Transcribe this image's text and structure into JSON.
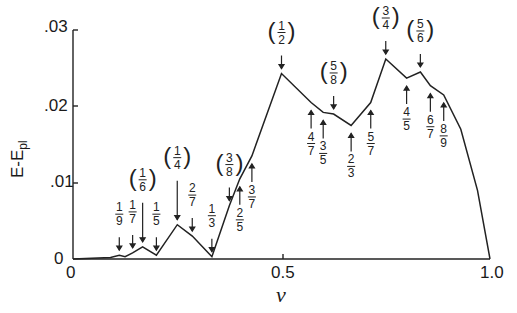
{
  "chart_data": {
    "type": "line",
    "title": "",
    "xlabel": "ν",
    "ylabel": "E-E_pl",
    "xlim": [
      0,
      1.0
    ],
    "ylim": [
      0,
      0.03
    ],
    "x_ticks": [
      "0",
      "0.5",
      "1.0"
    ],
    "y_ticks": [
      "0",
      ".01",
      ".02",
      ".03"
    ],
    "grid": false,
    "legend": null,
    "series": [
      {
        "name": "E-E_pl",
        "x": [
          0.0,
          0.09,
          0.111,
          0.125,
          0.143,
          0.167,
          0.2,
          0.25,
          0.286,
          0.333,
          0.375,
          0.4,
          0.429,
          0.5,
          0.571,
          0.6,
          0.625,
          0.667,
          0.714,
          0.75,
          0.8,
          0.833,
          0.857,
          0.889,
          0.93,
          0.97,
          1.0
        ],
        "y": [
          0.0,
          0.0002,
          0.0005,
          0.0003,
          0.0008,
          0.0016,
          0.0005,
          0.0045,
          0.003,
          0.0003,
          0.007,
          0.0105,
          0.0135,
          0.0243,
          0.0205,
          0.0192,
          0.019,
          0.0175,
          0.0205,
          0.0262,
          0.0237,
          0.0245,
          0.0227,
          0.0215,
          0.017,
          0.009,
          0.0
        ]
      }
    ],
    "annotations": [
      {
        "label": "1/9",
        "x": 0.111,
        "bracketed": false
      },
      {
        "label": "1/7",
        "x": 0.143,
        "bracketed": false
      },
      {
        "label": "(1/6)",
        "x": 0.167,
        "bracketed": true
      },
      {
        "label": "1/5",
        "x": 0.2,
        "bracketed": false
      },
      {
        "label": "(1/4)",
        "x": 0.25,
        "bracketed": true
      },
      {
        "label": "2/7",
        "x": 0.286,
        "bracketed": false
      },
      {
        "label": "1/3",
        "x": 0.333,
        "bracketed": false
      },
      {
        "label": "(3/8)",
        "x": 0.375,
        "bracketed": true
      },
      {
        "label": "2/5",
        "x": 0.4,
        "bracketed": false
      },
      {
        "label": "3/7",
        "x": 0.429,
        "bracketed": false
      },
      {
        "label": "(1/2)",
        "x": 0.5,
        "bracketed": true
      },
      {
        "label": "4/7",
        "x": 0.571,
        "bracketed": false
      },
      {
        "label": "3/5",
        "x": 0.6,
        "bracketed": false
      },
      {
        "label": "(5/8)",
        "x": 0.625,
        "bracketed": true
      },
      {
        "label": "2/3",
        "x": 0.667,
        "bracketed": false
      },
      {
        "label": "5/7",
        "x": 0.714,
        "bracketed": false
      },
      {
        "label": "(3/4)",
        "x": 0.75,
        "bracketed": true
      },
      {
        "label": "4/5",
        "x": 0.8,
        "bracketed": false
      },
      {
        "label": "(5/6)",
        "x": 0.833,
        "bracketed": true
      },
      {
        "label": "6/7",
        "x": 0.857,
        "bracketed": false
      },
      {
        "label": "8/9",
        "x": 0.889,
        "bracketed": false
      }
    ]
  },
  "axes": {
    "y_label_main": "E-E",
    "y_label_sub": "pl",
    "x_label": "ν",
    "y_tick_03": ".03",
    "y_tick_02": ".02",
    "y_tick_01": ".01",
    "y_tick_0": "0",
    "x_tick_0": "0",
    "x_tick_05": "0.5",
    "x_tick_10": "1.0"
  }
}
